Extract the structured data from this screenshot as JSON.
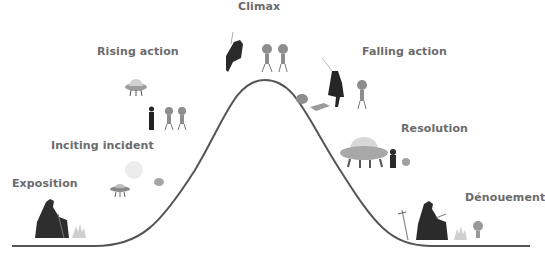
{
  "diagram": {
    "line_color": "#555555",
    "label_color": "#6b6b6b",
    "stages": [
      {
        "id": "exposition",
        "label": "Exposition"
      },
      {
        "id": "inciting-incident",
        "label": "Inciting incident"
      },
      {
        "id": "rising-action",
        "label": "Rising action"
      },
      {
        "id": "climax",
        "label": "Climax"
      },
      {
        "id": "falling-action",
        "label": "Falling action"
      },
      {
        "id": "resolution",
        "label": "Resolution"
      },
      {
        "id": "denouement",
        "label": "Dénouement"
      }
    ],
    "illustrations": [
      {
        "stage": "exposition",
        "depicts": "cloaked figure sitting by campfire"
      },
      {
        "stage": "inciting-incident",
        "depicts": "moon, small UFO and alien creature"
      },
      {
        "stage": "rising-action",
        "depicts": "UFO, cloaked figure and two robots"
      },
      {
        "stage": "climax",
        "depicts": "figure leaping with sword toward two robots"
      },
      {
        "stage": "falling-action",
        "depicts": "figure with sword, fallen robot, standing robot"
      },
      {
        "stage": "resolution",
        "depicts": "large UFO, figure and small robot"
      },
      {
        "stage": "denouement",
        "depicts": "sword in ground, figure sitting by campfire with small robot"
      }
    ]
  }
}
